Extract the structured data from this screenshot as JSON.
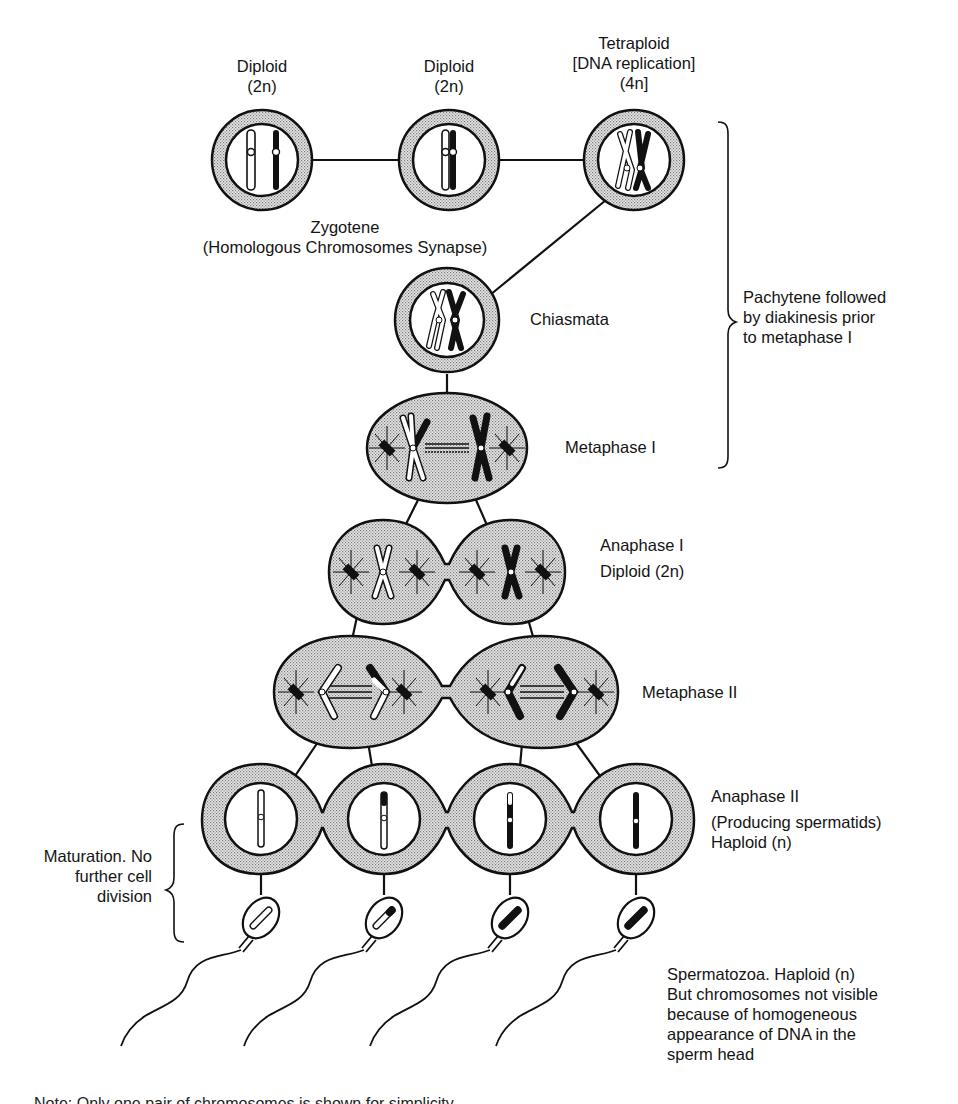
{
  "figure": {
    "type": "meiosis-spermatogenesis-flow",
    "top_row": [
      {
        "title": "Diploid",
        "subtitle": "(2n)"
      },
      {
        "title": "Diploid",
        "subtitle": "(2n)"
      },
      {
        "title": "Tetraploid",
        "subtitle": "[DNA replication]",
        "subtitle2": "(4n]"
      }
    ],
    "zygotene": {
      "line1": "Zygotene",
      "line2": "(Homologous Chromosomes Synapse)"
    },
    "chiasmata": "Chiasmata",
    "pachytene_bracket": {
      "line1": "Pachytene followed",
      "line2": "by diakinesis prior",
      "line3": "to metaphase I"
    },
    "metaphase1": "Metaphase I",
    "anaphase1": {
      "line1": "Anaphase I",
      "line2": "Diploid (2n)"
    },
    "metaphase2": "Metaphase II",
    "anaphase2": {
      "line1": "Anaphase II",
      "line2": "(Producing spermatids)",
      "line3": "Haploid  (n)"
    },
    "maturation_bracket": {
      "line1": "Maturation. No",
      "line2": "further cell",
      "line3": "division"
    },
    "spermatozoa": {
      "line1": "Spermatozoa. Haploid (n)",
      "line2": "But chromosomes not visible",
      "line3": "because of homogeneous",
      "line4": "appearance of DNA in the",
      "line5": "sperm head"
    },
    "footnote_clipped": "Note: Only one pair of chromosomes is shown for simplicity"
  },
  "colors": {
    "ink": "#111111",
    "stipple": "#bdbdbd",
    "paper": "#ffffff"
  }
}
